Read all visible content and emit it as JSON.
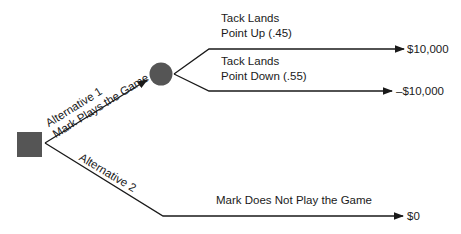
{
  "diagram": {
    "type": "decision-tree",
    "decision_node": {
      "shape": "square",
      "color": "#555555"
    },
    "chance_node": {
      "shape": "circle",
      "color": "#555555"
    },
    "branches": {
      "alt1": {
        "line1": "Alternative 1",
        "line2": "Mark Plays the Game"
      },
      "alt2": {
        "label": "Alternative 2"
      },
      "up": {
        "line1": "Tack Lands",
        "line2": "Point Up (.45)",
        "probability": 0.45
      },
      "down": {
        "line1": "Tack Lands",
        "line2": "Point Down (.55)",
        "probability": 0.55
      },
      "no_play": {
        "label": "Mark Does Not Play the Game"
      }
    },
    "outcomes": {
      "up": "$10,000",
      "down": "–$10,000",
      "no_play": "$0"
    },
    "line_color": "#1a1a1a"
  }
}
